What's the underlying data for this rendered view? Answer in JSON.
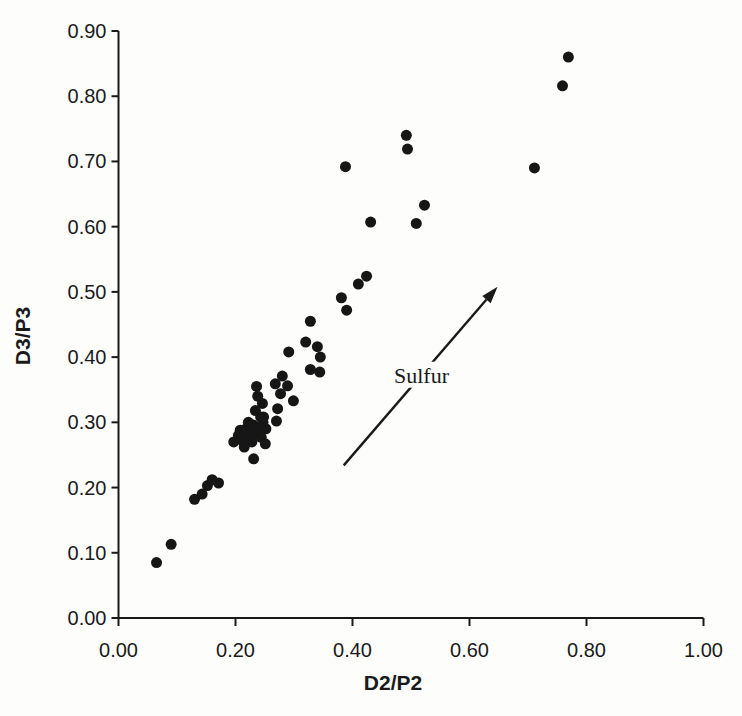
{
  "figure": {
    "background": "#fdfdfc",
    "ink_color": "#1a1a1a"
  },
  "chart_data": {
    "type": "scatter",
    "title": "",
    "xlabel": "D2/P2",
    "ylabel": "D3/P3",
    "xlim": [
      0.0,
      1.0
    ],
    "ylim": [
      0.0,
      0.9
    ],
    "grid": false,
    "legend": "none",
    "x_tick_labels": [
      "0.00",
      "0.20",
      "0.40",
      "0.60",
      "0.80",
      "1.00"
    ],
    "x_tick_values": [
      0.0,
      0.2,
      0.4,
      0.6,
      0.8,
      1.0
    ],
    "y_tick_labels": [
      "0.00",
      "0.10",
      "0.20",
      "0.30",
      "0.40",
      "0.50",
      "0.60",
      "0.70",
      "0.80",
      "0.90"
    ],
    "y_tick_values": [
      0.0,
      0.1,
      0.2,
      0.3,
      0.4,
      0.5,
      0.6,
      0.7,
      0.8,
      0.9
    ],
    "marker": {
      "shape": "circle",
      "color": "#161616",
      "radius_px": 5.5
    },
    "points": [
      [
        0.065,
        0.085
      ],
      [
        0.09,
        0.113
      ],
      [
        0.13,
        0.182
      ],
      [
        0.143,
        0.19
      ],
      [
        0.152,
        0.203
      ],
      [
        0.16,
        0.212
      ],
      [
        0.171,
        0.207
      ],
      [
        0.197,
        0.27
      ],
      [
        0.205,
        0.28
      ],
      [
        0.208,
        0.288
      ],
      [
        0.212,
        0.272
      ],
      [
        0.215,
        0.262
      ],
      [
        0.218,
        0.29
      ],
      [
        0.22,
        0.278
      ],
      [
        0.222,
        0.3
      ],
      [
        0.224,
        0.285
      ],
      [
        0.228,
        0.27
      ],
      [
        0.23,
        0.296
      ],
      [
        0.235,
        0.282
      ],
      [
        0.24,
        0.29
      ],
      [
        0.244,
        0.277
      ],
      [
        0.247,
        0.3
      ],
      [
        0.248,
        0.308
      ],
      [
        0.252,
        0.29
      ],
      [
        0.231,
        0.244
      ],
      [
        0.251,
        0.267
      ],
      [
        0.236,
        0.355
      ],
      [
        0.238,
        0.34
      ],
      [
        0.246,
        0.329
      ],
      [
        0.234,
        0.318
      ],
      [
        0.243,
        0.308
      ],
      [
        0.27,
        0.302
      ],
      [
        0.272,
        0.321
      ],
      [
        0.299,
        0.333
      ],
      [
        0.277,
        0.344
      ],
      [
        0.289,
        0.356
      ],
      [
        0.268,
        0.359
      ],
      [
        0.28,
        0.371
      ],
      [
        0.328,
        0.381
      ],
      [
        0.344,
        0.377
      ],
      [
        0.291,
        0.408
      ],
      [
        0.345,
        0.4
      ],
      [
        0.34,
        0.416
      ],
      [
        0.32,
        0.423
      ],
      [
        0.328,
        0.455
      ],
      [
        0.39,
        0.472
      ],
      [
        0.381,
        0.491
      ],
      [
        0.41,
        0.512
      ],
      [
        0.424,
        0.524
      ],
      [
        0.431,
        0.607
      ],
      [
        0.509,
        0.605
      ],
      [
        0.523,
        0.633
      ],
      [
        0.388,
        0.692
      ],
      [
        0.492,
        0.74
      ],
      [
        0.494,
        0.719
      ],
      [
        0.711,
        0.69
      ],
      [
        0.759,
        0.816
      ],
      [
        0.769,
        0.86
      ]
    ],
    "annotation": {
      "text": "Sulfur",
      "arrow_from": [
        0.385,
        0.234
      ],
      "arrow_to": [
        0.648,
        0.508
      ],
      "label_at": [
        0.518,
        0.373
      ]
    }
  }
}
